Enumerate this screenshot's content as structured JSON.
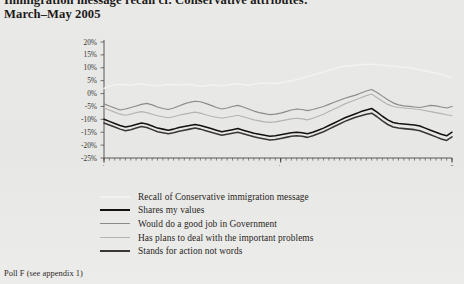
{
  "title": {
    "line1": "Immigration message recall cf. Conservative attributes:",
    "line2": "March–May 2005"
  },
  "footer": {
    "note": "Poll F (see appendix 1)"
  },
  "legend": {
    "position": "below-chart",
    "items": [
      {
        "label": "Recall of Conservative immigration message",
        "color": "#f2f2f0",
        "width": 2.1
      },
      {
        "label": "Shares my values",
        "color": "#14110f",
        "width": 2.1
      },
      {
        "label": "Would do a good job in Government",
        "color": "#8d8b87",
        "width": 1.5
      },
      {
        "label": "Has plans to deal with the important problems",
        "color": "#b6b4b0",
        "width": 1.5
      },
      {
        "label": "Stands for action not words",
        "color": "#3a3734",
        "width": 2.1
      }
    ]
  },
  "chart_data": {
    "type": "line",
    "title": "Immigration message recall cf. Conservative attributes: March–May 2005",
    "xlabel": "",
    "ylabel": "",
    "grid": false,
    "ylim": [
      -25,
      20
    ],
    "ytick_labels": [
      "20%",
      "15%",
      "10%",
      "5%",
      "0%",
      "-5%",
      "-10%",
      "-15%",
      "-20%",
      "-25%"
    ],
    "ytick_values": [
      20,
      15,
      10,
      5,
      0,
      -5,
      -10,
      -15,
      -20,
      -25
    ],
    "xtick_labels": [
      "1-4 Mar",
      "3-6 Apr",
      "10-04 May"
    ],
    "xtick_positions": [
      0,
      33,
      65
    ],
    "n_points": 66,
    "series": [
      {
        "name": "Recall of Conservative immigration message",
        "color": "#f2f2f0",
        "values": [
          2.0,
          2.8,
          3.4,
          3.6,
          3.4,
          3.2,
          3.6,
          3.8,
          3.4,
          3.2,
          3.0,
          3.2,
          3.6,
          3.4,
          3.2,
          3.4,
          3.6,
          3.2,
          2.8,
          3.0,
          3.4,
          3.2,
          3.0,
          3.2,
          3.6,
          3.8,
          3.4,
          3.2,
          3.6,
          4.0,
          4.2,
          4.0,
          3.8,
          4.2,
          4.6,
          5.0,
          5.4,
          6.0,
          6.6,
          7.2,
          7.8,
          8.4,
          9.0,
          9.6,
          10.2,
          10.6,
          10.8,
          11.0,
          11.2,
          11.4,
          11.4,
          11.2,
          11.0,
          10.8,
          10.6,
          10.4,
          10.2,
          10.0,
          9.6,
          9.2,
          8.8,
          8.4,
          8.0,
          7.4,
          6.8,
          6.2
        ]
      },
      {
        "name": "Would do a good job in Government",
        "color": "#8d8b87",
        "values": [
          -4.0,
          -4.8,
          -5.6,
          -6.4,
          -6.0,
          -5.4,
          -4.8,
          -4.2,
          -3.8,
          -4.4,
          -5.2,
          -5.8,
          -6.2,
          -5.6,
          -4.8,
          -4.0,
          -3.4,
          -3.0,
          -3.2,
          -3.8,
          -4.6,
          -5.4,
          -6.0,
          -5.6,
          -5.0,
          -4.6,
          -5.2,
          -6.0,
          -6.8,
          -7.4,
          -7.8,
          -8.2,
          -8.0,
          -7.6,
          -7.0,
          -6.4,
          -6.0,
          -6.2,
          -6.6,
          -6.2,
          -5.6,
          -5.0,
          -4.2,
          -3.4,
          -2.6,
          -1.8,
          -1.2,
          -0.6,
          0.2,
          1.0,
          1.6,
          0.4,
          -1.0,
          -2.4,
          -3.6,
          -4.4,
          -4.8,
          -5.0,
          -5.2,
          -5.4,
          -5.0,
          -4.6,
          -4.8,
          -5.2,
          -5.6,
          -5.0
        ]
      },
      {
        "name": "Has plans to deal with the important problems",
        "color": "#b6b4b0",
        "values": [
          -5.6,
          -6.4,
          -7.2,
          -8.0,
          -8.4,
          -8.0,
          -7.4,
          -7.0,
          -7.4,
          -8.0,
          -8.6,
          -9.0,
          -9.4,
          -9.0,
          -8.4,
          -8.0,
          -7.6,
          -7.2,
          -7.6,
          -8.2,
          -8.8,
          -9.2,
          -9.6,
          -9.2,
          -8.8,
          -8.4,
          -9.0,
          -9.6,
          -10.2,
          -10.6,
          -11.0,
          -11.2,
          -11.0,
          -10.6,
          -10.2,
          -9.8,
          -9.6,
          -9.8,
          -10.2,
          -9.6,
          -8.8,
          -8.0,
          -7.0,
          -6.0,
          -5.0,
          -4.0,
          -3.2,
          -2.4,
          -1.6,
          -0.8,
          -0.2,
          -1.6,
          -3.0,
          -4.2,
          -5.0,
          -5.4,
          -5.6,
          -5.8,
          -6.0,
          -6.2,
          -6.6,
          -7.0,
          -7.4,
          -7.8,
          -8.2,
          -8.6
        ]
      },
      {
        "name": "Shares my values",
        "color": "#14110f",
        "values": [
          -10.0,
          -10.8,
          -11.6,
          -12.4,
          -13.0,
          -12.6,
          -12.0,
          -11.4,
          -11.8,
          -12.6,
          -13.4,
          -13.8,
          -14.2,
          -13.8,
          -13.2,
          -12.8,
          -12.4,
          -12.0,
          -12.4,
          -13.0,
          -13.6,
          -14.2,
          -14.8,
          -14.4,
          -14.0,
          -13.6,
          -14.2,
          -14.8,
          -15.4,
          -15.8,
          -16.2,
          -16.6,
          -16.4,
          -16.0,
          -15.6,
          -15.2,
          -15.0,
          -15.2,
          -15.6,
          -15.0,
          -14.2,
          -13.4,
          -12.4,
          -11.4,
          -10.4,
          -9.4,
          -8.6,
          -7.8,
          -7.0,
          -6.4,
          -5.8,
          -7.2,
          -8.8,
          -10.2,
          -11.2,
          -11.6,
          -11.8,
          -12.0,
          -12.2,
          -12.6,
          -13.4,
          -14.2,
          -15.0,
          -15.8,
          -16.4,
          -15.0
        ]
      },
      {
        "name": "Stands for action not words",
        "color": "#3a3734",
        "values": [
          -11.4,
          -12.2,
          -13.0,
          -13.8,
          -14.4,
          -14.0,
          -13.4,
          -12.8,
          -13.2,
          -14.0,
          -14.8,
          -15.2,
          -15.6,
          -15.2,
          -14.6,
          -14.2,
          -13.8,
          -13.4,
          -13.8,
          -14.4,
          -15.0,
          -15.6,
          -16.2,
          -15.8,
          -15.4,
          -15.0,
          -15.6,
          -16.2,
          -16.8,
          -17.2,
          -17.6,
          -18.0,
          -17.8,
          -17.4,
          -17.0,
          -16.6,
          -16.4,
          -16.6,
          -17.0,
          -16.4,
          -15.6,
          -14.8,
          -13.8,
          -12.8,
          -11.8,
          -10.8,
          -10.0,
          -9.2,
          -8.6,
          -8.0,
          -7.6,
          -9.0,
          -10.6,
          -12.0,
          -13.0,
          -13.4,
          -13.6,
          -13.8,
          -14.0,
          -14.4,
          -15.2,
          -16.0,
          -16.8,
          -17.6,
          -18.2,
          -16.8
        ]
      }
    ]
  }
}
